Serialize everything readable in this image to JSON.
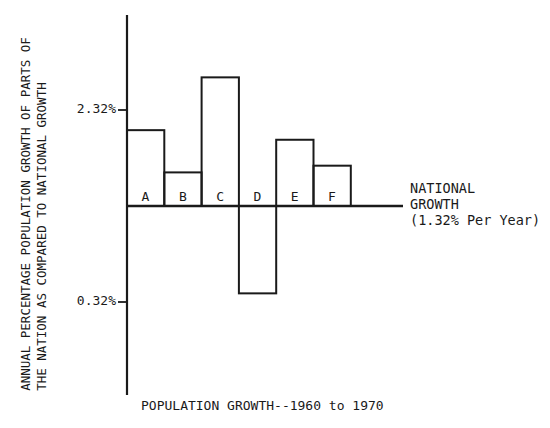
{
  "chart_data": {
    "type": "bar",
    "title": "",
    "xlabel": "POPULATION GROWTH--1960 to 1970",
    "ylabel_lines": [
      "ANNUAL PERCENTAGE POPULATION GROWTH OF PARTS OF",
      "THE NATION AS COMPARED TO NATIONAL GROWTH"
    ],
    "categories": [
      "A",
      "B",
      "C",
      "D",
      "E",
      "F"
    ],
    "values": [
      2.11,
      1.67,
      2.66,
      0.41,
      2.01,
      1.74
    ],
    "baseline": 1.32,
    "baseline_label_lines": [
      "NATIONAL",
      "GROWTH",
      "(1.32% Per Year)"
    ],
    "yticks": [
      {
        "value": 2.32,
        "label": "2.32%"
      },
      {
        "value": 0.32,
        "label": "0.32%"
      }
    ],
    "ylim": [
      -0.68,
      3.4
    ],
    "grid": false,
    "legend": "none",
    "bar_fill": "none",
    "bar_stroke": "#1a1a1a"
  }
}
